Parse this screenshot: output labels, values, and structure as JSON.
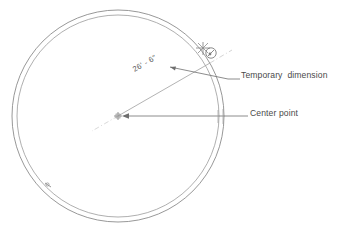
{
  "drawing": {
    "type": "cad-circle-temporary-dimension",
    "background_color": "#ffffff",
    "line_color": "#8a8a8a",
    "text_color": "#4a4a4a",
    "circle": {
      "center_x": 118,
      "center_y": 116,
      "outer_radius": 106,
      "inner_radius": 101
    },
    "dimension": {
      "value": "26' - 6\"",
      "angle_degrees": -30
    },
    "cursor": {
      "snap_marker": "snap-star-icon",
      "cursor_glyph": "circle-cursor-icon"
    }
  },
  "annotations": {
    "temporary_dimension": {
      "label": "Temporary  dimension"
    },
    "center_point": {
      "label": "Center point"
    }
  }
}
